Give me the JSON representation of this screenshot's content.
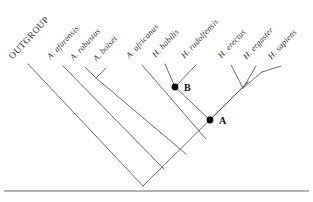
{
  "figure": {
    "type": "cladogram",
    "width": 313,
    "height": 202,
    "background_color": "#ffffff",
    "line_color": "#5a5a5a",
    "node_color": "#000000",
    "rule_color": "#555555"
  },
  "tips": [
    {
      "id": "outgroup",
      "label": "OUTGROUP",
      "italic": false,
      "label_x": 14,
      "label_y": 62,
      "tip_x": 28,
      "tip_y": 64
    },
    {
      "id": "a-afarensis",
      "label": "A. afarensis",
      "italic": true,
      "label_x": 52,
      "label_y": 63,
      "tip_x": 63,
      "tip_y": 66
    },
    {
      "id": "a-robustus",
      "label": "A. robustus",
      "italic": true,
      "label_x": 75,
      "label_y": 64,
      "tip_x": 85,
      "tip_y": 67
    },
    {
      "id": "a-boisei",
      "label": "A. boisei",
      "italic": true,
      "label_x": 98,
      "label_y": 65,
      "tip_x": 106,
      "tip_y": 68
    },
    {
      "id": "a-africanus",
      "label": "A. africanus",
      "italic": true,
      "label_x": 131,
      "label_y": 62,
      "tip_x": 142,
      "tip_y": 65
    },
    {
      "id": "h-habilis",
      "label": "H. habilis",
      "italic": true,
      "label_x": 157,
      "label_y": 61,
      "tip_x": 165,
      "tip_y": 64
    },
    {
      "id": "h-rudolfensis",
      "label": "H. rudolfensis",
      "italic": true,
      "label_x": 186,
      "label_y": 62,
      "tip_x": 196,
      "tip_y": 65
    },
    {
      "id": "h-erectus",
      "label": "H. erectus",
      "italic": true,
      "label_x": 223,
      "label_y": 62,
      "tip_x": 231,
      "tip_y": 65
    },
    {
      "id": "h-ergaster",
      "label": "H. ergaster",
      "italic": true,
      "label_x": 248,
      "label_y": 63,
      "tip_x": 256,
      "tip_y": 66
    },
    {
      "id": "h-sapiens",
      "label": "H. sapiens",
      "italic": true,
      "label_x": 273,
      "label_y": 63,
      "tip_x": 281,
      "tip_y": 66
    }
  ],
  "internal_nodes": [
    {
      "id": "node-b",
      "label": "B",
      "x": 175,
      "y": 87,
      "dot": true,
      "label_x": 184,
      "label_y": 82
    },
    {
      "id": "node-a",
      "label": "A",
      "x": 210,
      "y": 120,
      "dot": true,
      "label_x": 219,
      "label_y": 115
    }
  ],
  "branches": [
    {
      "id": "branch-outgroup",
      "x1": 28,
      "y1": 64,
      "x2": 143,
      "y2": 186
    },
    {
      "id": "branch-root-right",
      "x1": 143,
      "y1": 186,
      "x2": 248,
      "y2": 82
    },
    {
      "id": "branch-a-afarensis",
      "x1": 63,
      "y1": 66,
      "x2": 164,
      "y2": 169
    },
    {
      "id": "branch-a-robustus",
      "x1": 85,
      "y1": 67,
      "x2": 96,
      "y2": 78
    },
    {
      "id": "branch-a-boisei",
      "x1": 106,
      "y1": 68,
      "x2": 96,
      "y2": 78
    },
    {
      "id": "branch-robustus-clade",
      "x1": 96,
      "y1": 78,
      "x2": 186,
      "y2": 154
    },
    {
      "id": "branch-a-africanus",
      "x1": 142,
      "y1": 65,
      "x2": 206,
      "y2": 139
    },
    {
      "id": "branch-h-habilis",
      "x1": 165,
      "y1": 64,
      "x2": 175,
      "y2": 87
    },
    {
      "id": "branch-b-down",
      "x1": 175,
      "y1": 87,
      "x2": 210,
      "y2": 120
    },
    {
      "id": "branch-h-rudolfensis",
      "x1": 196,
      "y1": 65,
      "x2": 175,
      "y2": 87
    },
    {
      "id": "branch-a-up-right",
      "x1": 210,
      "y1": 120,
      "x2": 248,
      "y2": 82
    },
    {
      "id": "branch-h-erectus",
      "x1": 231,
      "y1": 65,
      "x2": 243,
      "y2": 88
    },
    {
      "id": "branch-h-ergaster",
      "x1": 256,
      "y1": 66,
      "x2": 243,
      "y2": 88
    },
    {
      "id": "branch-erectus-clade",
      "x1": 243,
      "y1": 88,
      "x2": 262,
      "y2": 72
    },
    {
      "id": "branch-h-sapiens",
      "x1": 281,
      "y1": 66,
      "x2": 262,
      "y2": 72
    }
  ],
  "footer_rule": {
    "id": "bottom-rule",
    "x1": 4,
    "y1": 191,
    "x2": 309,
    "y2": 191
  }
}
